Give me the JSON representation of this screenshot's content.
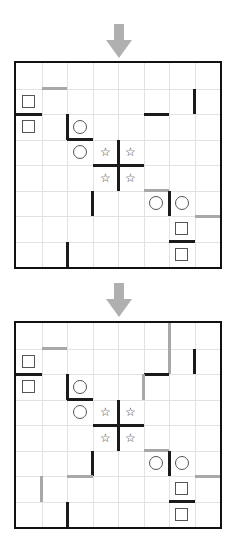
{
  "figure": {
    "type": "puzzle-grid-pair",
    "grid_size": {
      "cols": 8,
      "rows": 8
    },
    "arrow_icon": "arrow-down-icon",
    "colors": {
      "wall_black": "#1a1a1a",
      "wall_gray": "#a8a8a8",
      "gridline": "#e2e2e2",
      "border": "#111111",
      "arrow": "#b0b0b0",
      "symbol": "#555555"
    },
    "symbol_glyphs": {
      "circle": "○",
      "square": "□",
      "star": "☆"
    }
  },
  "panels": [
    {
      "id": "panel-top",
      "label": "",
      "arrow": {
        "name": "arrow-down-icon",
        "direction": "down"
      },
      "symbols": [
        {
          "kind": "square",
          "col": 0,
          "row": 1
        },
        {
          "kind": "square",
          "col": 0,
          "row": 2
        },
        {
          "kind": "circle",
          "col": 2,
          "row": 2
        },
        {
          "kind": "circle",
          "col": 2,
          "row": 3
        },
        {
          "kind": "star",
          "col": 3,
          "row": 3
        },
        {
          "kind": "star",
          "col": 4,
          "row": 3
        },
        {
          "kind": "star",
          "col": 3,
          "row": 4
        },
        {
          "kind": "star",
          "col": 4,
          "row": 4
        },
        {
          "kind": "circle",
          "col": 5,
          "row": 5
        },
        {
          "kind": "circle",
          "col": 6,
          "row": 5
        },
        {
          "kind": "square",
          "col": 6,
          "row": 6
        },
        {
          "kind": "square",
          "col": 6,
          "row": 7
        }
      ],
      "walls": [
        {
          "color": "gray",
          "orient": "h",
          "col": 1,
          "row": 1,
          "len": 1
        },
        {
          "color": "black",
          "orient": "v",
          "col": 7,
          "row": 1,
          "len": 1
        },
        {
          "color": "black",
          "orient": "h",
          "col": 0,
          "row": 2,
          "len": 1
        },
        {
          "color": "black",
          "orient": "h",
          "col": 5,
          "row": 2,
          "len": 1
        },
        {
          "color": "black",
          "orient": "v",
          "col": 2,
          "row": 2,
          "len": 1
        },
        {
          "color": "black",
          "orient": "h",
          "col": 2,
          "row": 3,
          "len": 1
        },
        {
          "color": "black",
          "orient": "v",
          "col": 4,
          "row": 3,
          "len": 2
        },
        {
          "color": "black",
          "orient": "h",
          "col": 3,
          "row": 4,
          "len": 2
        },
        {
          "color": "black",
          "orient": "v",
          "col": 3,
          "row": 5,
          "len": 1
        },
        {
          "color": "gray",
          "orient": "h",
          "col": 5,
          "row": 5,
          "len": 1
        },
        {
          "color": "black",
          "orient": "v",
          "col": 6,
          "row": 5,
          "len": 1
        },
        {
          "color": "gray",
          "orient": "h",
          "col": 7,
          "row": 6,
          "len": 1
        },
        {
          "color": "black",
          "orient": "h",
          "col": 6,
          "row": 7,
          "len": 1
        },
        {
          "color": "black",
          "orient": "v",
          "col": 2,
          "row": 7,
          "len": 1
        }
      ]
    },
    {
      "id": "panel-bottom",
      "label": "",
      "arrow": {
        "name": "arrow-down-icon",
        "direction": "down"
      },
      "symbols": [
        {
          "kind": "square",
          "col": 0,
          "row": 1
        },
        {
          "kind": "square",
          "col": 0,
          "row": 2
        },
        {
          "kind": "circle",
          "col": 2,
          "row": 2
        },
        {
          "kind": "circle",
          "col": 2,
          "row": 3
        },
        {
          "kind": "star",
          "col": 3,
          "row": 3
        },
        {
          "kind": "star",
          "col": 4,
          "row": 3
        },
        {
          "kind": "star",
          "col": 3,
          "row": 4
        },
        {
          "kind": "star",
          "col": 4,
          "row": 4
        },
        {
          "kind": "circle",
          "col": 5,
          "row": 5
        },
        {
          "kind": "circle",
          "col": 6,
          "row": 5
        },
        {
          "kind": "square",
          "col": 6,
          "row": 6
        },
        {
          "kind": "square",
          "col": 6,
          "row": 7
        }
      ],
      "walls": [
        {
          "color": "gray",
          "orient": "v",
          "col": 6,
          "row": 0,
          "len": 2
        },
        {
          "color": "gray",
          "orient": "h",
          "col": 1,
          "row": 1,
          "len": 1
        },
        {
          "color": "black",
          "orient": "v",
          "col": 7,
          "row": 1,
          "len": 1
        },
        {
          "color": "black",
          "orient": "h",
          "col": 0,
          "row": 2,
          "len": 1
        },
        {
          "color": "black",
          "orient": "h",
          "col": 5,
          "row": 2,
          "len": 1
        },
        {
          "color": "gray",
          "orient": "v",
          "col": 5,
          "row": 2,
          "len": 1
        },
        {
          "color": "black",
          "orient": "v",
          "col": 2,
          "row": 2,
          "len": 1
        },
        {
          "color": "black",
          "orient": "h",
          "col": 2,
          "row": 3,
          "len": 1
        },
        {
          "color": "black",
          "orient": "v",
          "col": 4,
          "row": 3,
          "len": 2
        },
        {
          "color": "black",
          "orient": "h",
          "col": 3,
          "row": 4,
          "len": 2
        },
        {
          "color": "black",
          "orient": "v",
          "col": 3,
          "row": 5,
          "len": 1
        },
        {
          "color": "gray",
          "orient": "h",
          "col": 5,
          "row": 5,
          "len": 1
        },
        {
          "color": "black",
          "orient": "v",
          "col": 6,
          "row": 5,
          "len": 1
        },
        {
          "color": "gray",
          "orient": "h",
          "col": 2,
          "row": 6,
          "len": 1
        },
        {
          "color": "gray",
          "orient": "v",
          "col": 1,
          "row": 6,
          "len": 1
        },
        {
          "color": "gray",
          "orient": "h",
          "col": 7,
          "row": 6,
          "len": 1
        },
        {
          "color": "black",
          "orient": "h",
          "col": 6,
          "row": 7,
          "len": 1
        },
        {
          "color": "black",
          "orient": "v",
          "col": 2,
          "row": 7,
          "len": 1
        }
      ]
    }
  ]
}
